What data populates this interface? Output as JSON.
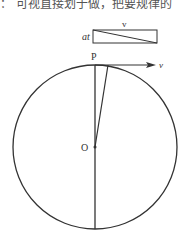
{
  "header_text": "：  可视直接划于做，把要规律的",
  "diagram": {
    "rect_label_side": "at",
    "rect_label_top": "v",
    "point_top": "P",
    "point_center": "O",
    "velocity_label": "v",
    "stroke_color": "#333333"
  }
}
